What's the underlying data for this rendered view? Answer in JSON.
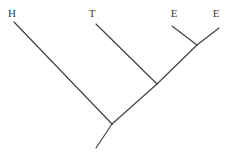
{
  "figure": {
    "type": "cladogram",
    "width": 232,
    "height": 154,
    "background_color": "#ffffff",
    "line_color": "#3b3b3b",
    "line_width": 1.1,
    "label_color": "#3b3b3b",
    "label_font_size": 11
  },
  "tips": [
    {
      "id": "tip-h",
      "label": "H",
      "label_x": 12,
      "label_y": 8,
      "x": 14,
      "y": 22
    },
    {
      "id": "tip-t",
      "label": "T",
      "label_x": 92,
      "label_y": 8,
      "x": 96,
      "y": 24
    },
    {
      "id": "tip-e1",
      "label": "E",
      "label_x": 174,
      "label_y": 8,
      "x": 172,
      "y": 26
    },
    {
      "id": "tip-e2",
      "label": "E",
      "label_x": 216,
      "label_y": 8,
      "x": 219,
      "y": 28
    }
  ],
  "nodes": [
    {
      "id": "node-ee",
      "x": 197,
      "y": 45
    },
    {
      "id": "node-tee",
      "x": 157,
      "y": 84
    },
    {
      "id": "node-htee",
      "x": 112,
      "y": 124
    },
    {
      "id": "root-end",
      "x": 96,
      "y": 148
    }
  ],
  "branches": [
    {
      "id": "branch-e1",
      "name": "branch-to-tip-e1",
      "x1": 172,
      "y1": 26,
      "x2": 197,
      "y2": 45
    },
    {
      "id": "branch-e2",
      "name": "branch-to-tip-e2",
      "x1": 219,
      "y1": 28,
      "x2": 197,
      "y2": 45
    },
    {
      "id": "branch-ee",
      "name": "branch-ee-to-tee",
      "x1": 197,
      "y1": 45,
      "x2": 157,
      "y2": 84
    },
    {
      "id": "branch-t",
      "name": "branch-to-tip-t",
      "x1": 96,
      "y1": 24,
      "x2": 157,
      "y2": 84
    },
    {
      "id": "branch-tee",
      "name": "branch-tee-to-htee",
      "x1": 157,
      "y1": 84,
      "x2": 112,
      "y2": 124
    },
    {
      "id": "branch-h",
      "name": "branch-to-tip-h",
      "x1": 14,
      "y1": 22,
      "x2": 112,
      "y2": 124
    },
    {
      "id": "branch-root",
      "name": "root-branch",
      "x1": 112,
      "y1": 124,
      "x2": 96,
      "y2": 148
    }
  ]
}
